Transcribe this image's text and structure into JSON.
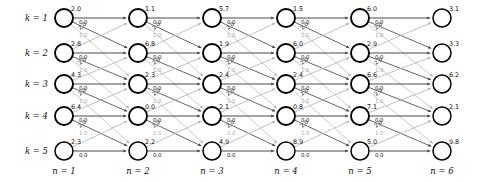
{
  "figure": {
    "type": "trellis-diagram",
    "title": "",
    "rows": 5,
    "columns": 6,
    "node_radius_px": 9,
    "colors": {
      "node_stroke": "#000000",
      "node_fill": "#ffffff",
      "edge_dark": "#4a4a4a",
      "edge_light": "#b5b5b5",
      "text": "#111111",
      "label_light": "#a8a8a8",
      "background": "#ffffff"
    }
  },
  "row_labels": [
    {
      "text": "k = 1"
    },
    {
      "text": "k = 2"
    },
    {
      "text": "k = 3"
    },
    {
      "text": "k = 4"
    },
    {
      "text": "k = 5"
    }
  ],
  "column_labels": [
    {
      "text": "n = 1"
    },
    {
      "text": "n = 2"
    },
    {
      "text": "n = 3"
    },
    {
      "text": "n = 4"
    },
    {
      "text": "n = 5"
    },
    {
      "text": "n = 6"
    }
  ],
  "chart_data": {
    "type": "diagram",
    "xlabel": "n",
    "ylabel": "k",
    "categories": [
      "n = 1",
      "n = 2",
      "n = 3",
      "n = 4",
      "n = 5",
      "n = 6"
    ],
    "row_categories": [
      "k = 1",
      "k = 2",
      "k = 3",
      "k = 4",
      "k = 5"
    ],
    "node_values": [
      {
        "column": 1,
        "values": [
          "2.0",
          "2.8",
          "4.3",
          "6.4",
          "2.3"
        ]
      },
      {
        "column": 2,
        "values": [
          "1.1",
          "6.8",
          "2.3",
          "0.0",
          "2.2"
        ]
      },
      {
        "column": 3,
        "values": [
          "5.7",
          "1.9",
          "2.4",
          "2.1",
          "4.9"
        ]
      },
      {
        "column": 4,
        "values": [
          "1.5",
          "6.0",
          "2.4",
          "0.8",
          "8.9"
        ]
      },
      {
        "column": 5,
        "values": [
          "6.0",
          "2.9",
          "6.6",
          "7.1",
          "5.0"
        ]
      },
      {
        "column": 6,
        "values": [
          "3.1",
          "3.3",
          "6.2",
          "2.1",
          "9.8"
        ]
      }
    ],
    "branch_labels": {
      "horizontal": "0.0",
      "diagonal_upper": "2.0",
      "diagonal_lower": "1.0"
    },
    "legend": [],
    "grid": false
  }
}
